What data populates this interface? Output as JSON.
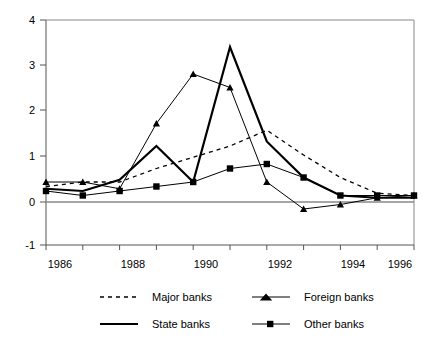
{
  "chart_data": {
    "type": "line",
    "title": "",
    "subtitle": "",
    "xlabel": "",
    "ylabel": "",
    "x": [
      1986,
      1987,
      1988,
      1989,
      1990,
      1991,
      1992,
      1993,
      1994,
      1995,
      1996
    ],
    "xlim": [
      1986,
      1996
    ],
    "ylim": [
      -1,
      4
    ],
    "yticks": [
      -1,
      0,
      1,
      2,
      3,
      4
    ],
    "ytick_labels": [
      "-1",
      "0",
      "1",
      "2",
      "3",
      "4"
    ],
    "xticks": [
      1986,
      1987,
      1988,
      1989,
      1990,
      1991,
      1992,
      1993,
      1994,
      1995,
      1996
    ],
    "xtick_labels": [
      "1986",
      "",
      "1988",
      "",
      "1990",
      "",
      "1992",
      "",
      "1994",
      "",
      "1996"
    ],
    "xtick_labels_shown": [
      "1986",
      "1988",
      "1990",
      "1992",
      "1994",
      "1996"
    ],
    "grid": false,
    "zero_line": true,
    "legend_position": "bottom",
    "series": [
      {
        "name": "Major banks",
        "style": "dashed",
        "marker": "none",
        "color": "#000000",
        "values": [
          0.3,
          0.4,
          0.4,
          0.7,
          0.95,
          1.2,
          1.55,
          1.0,
          0.5,
          0.15,
          0.1
        ]
      },
      {
        "name": "State banks",
        "style": "solid-thick",
        "marker": "none",
        "color": "#000000",
        "values": [
          0.25,
          0.2,
          0.45,
          1.2,
          0.4,
          3.4,
          1.3,
          0.5,
          0.1,
          0.05,
          0.05
        ]
      },
      {
        "name": "Foreign banks",
        "style": "solid-thin",
        "marker": "triangle",
        "color": "#000000",
        "values": [
          0.4,
          0.4,
          0.25,
          1.7,
          2.8,
          2.5,
          0.4,
          -0.2,
          -0.1,
          0.05,
          0.1
        ]
      },
      {
        "name": "Other banks",
        "style": "solid-thin",
        "marker": "square",
        "color": "#000000",
        "values": [
          0.2,
          0.1,
          0.2,
          0.3,
          0.4,
          0.7,
          0.8,
          0.5,
          0.1,
          0.1,
          0.1
        ]
      }
    ]
  },
  "legend": {
    "entries": [
      {
        "label": "Major banks",
        "key": "major-banks"
      },
      {
        "label": "Foreign banks",
        "key": "foreign-banks"
      },
      {
        "label": "State banks",
        "key": "state-banks"
      },
      {
        "label": "Other banks",
        "key": "other-banks"
      }
    ]
  },
  "axes": {
    "y_labels": [
      "4",
      "3",
      "2",
      "1",
      "0",
      "-1"
    ],
    "x_labels": [
      "1986",
      "1988",
      "1990",
      "1992",
      "1994",
      "1996"
    ]
  },
  "colors": {
    "ink": "#000000",
    "axis": "#555555",
    "background": "#ffffff"
  }
}
